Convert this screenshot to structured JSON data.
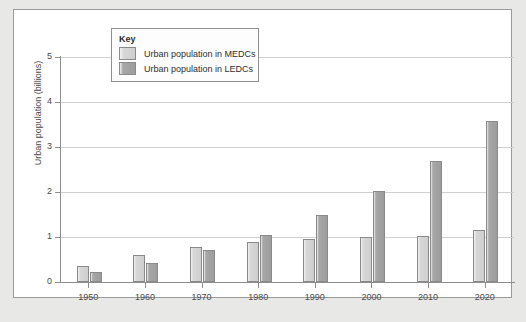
{
  "chart_data": {
    "type": "bar",
    "title": "",
    "xlabel": "",
    "ylabel": "Urban population (billions)",
    "ylim": [
      0,
      5
    ],
    "yticks": [
      0,
      1,
      2,
      3,
      4,
      5
    ],
    "grid": true,
    "legend_position": "top-center",
    "legend_title": "Key",
    "categories": [
      "1950",
      "1960",
      "1970",
      "1980",
      "1990",
      "2000",
      "2010",
      "2020"
    ],
    "series": [
      {
        "name": "Urban population in MEDCs",
        "color": "#cfcfcf",
        "values": [
          0.35,
          0.6,
          0.78,
          0.88,
          0.95,
          1.0,
          1.02,
          1.15
        ]
      },
      {
        "name": "Urban population in LEDCs",
        "color": "#9d9d9d",
        "values": [
          0.22,
          0.42,
          0.72,
          1.05,
          1.5,
          2.02,
          2.68,
          3.57
        ]
      }
    ]
  }
}
